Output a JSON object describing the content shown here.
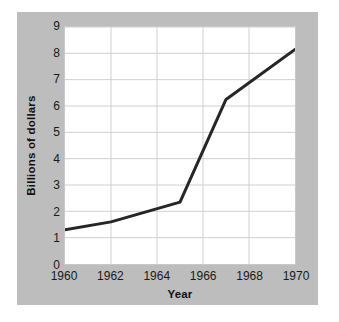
{
  "chart_data": {
    "type": "line",
    "title": "",
    "xlabel": "Year",
    "ylabel": "Billions of dollars",
    "xlim": [
      1960,
      1970
    ],
    "ylim": [
      0,
      9
    ],
    "grid": true,
    "legend": "none",
    "x_tick_labels": [
      "1960",
      "1962",
      "1964",
      "1966",
      "1968",
      "1970"
    ],
    "x_tick_values": [
      1960,
      1962,
      1964,
      1966,
      1968,
      1970
    ],
    "y_tick_labels": [
      "0",
      "1",
      "2",
      "3",
      "4",
      "5",
      "6",
      "7",
      "8",
      "9"
    ],
    "y_tick_values": [
      0,
      1,
      2,
      3,
      4,
      5,
      6,
      7,
      8,
      9
    ],
    "x": [
      1960,
      1962,
      1965,
      1967,
      1970
    ],
    "values": [
      1.3,
      1.6,
      2.35,
      6.25,
      8.15
    ],
    "series": [
      {
        "name": "Billions of dollars",
        "points": [
          {
            "x": 1960,
            "y": 1.3
          },
          {
            "x": 1962,
            "y": 1.6
          },
          {
            "x": 1965,
            "y": 2.35
          },
          {
            "x": 1967,
            "y": 6.25
          },
          {
            "x": 1970,
            "y": 8.15
          }
        ]
      }
    ],
    "line_color": "#262626",
    "grid_color": "#d0d0d0",
    "plot_background": "#ffffff",
    "panel_background": "#bdbdbd"
  }
}
